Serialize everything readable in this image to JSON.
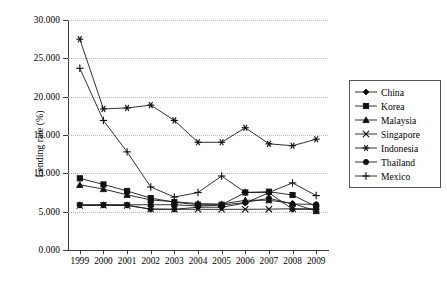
{
  "chart_data": {
    "type": "line",
    "title": "",
    "xlabel": "",
    "ylabel": "Lending rate (%)",
    "x": [
      "1999",
      "2000",
      "2001",
      "2002",
      "2003",
      "2004",
      "2005",
      "2006",
      "2007",
      "2008",
      "2009"
    ],
    "categories": [
      "1999",
      "2000",
      "2001",
      "2002",
      "2003",
      "2004",
      "2005",
      "2006",
      "2007",
      "2008",
      "2009"
    ],
    "ylim": [
      0,
      30
    ],
    "yticks": [
      0,
      5,
      10,
      15,
      20,
      25,
      30
    ],
    "ytick_labels": [
      "0.000",
      "5.000",
      "10.000",
      "15.000",
      "20.000",
      "25.000",
      "30.000"
    ],
    "grid": "horizontal-dotted",
    "legend_position": "right",
    "series": [
      {
        "name": "China",
        "marker": "diamond",
        "values": [
          5.85,
          5.85,
          5.85,
          5.31,
          5.31,
          5.58,
          5.58,
          6.12,
          7.47,
          5.31,
          5.31
        ]
      },
      {
        "name": "Korea",
        "marker": "square",
        "values": [
          9.35,
          8.55,
          7.7,
          6.77,
          6.24,
          5.91,
          5.9,
          7.5,
          7.6,
          7.17,
          5.65
        ]
      },
      {
        "name": "Malaysia",
        "marker": "triangle",
        "values": [
          8.5,
          7.95,
          7.2,
          6.53,
          6.3,
          6.05,
          6.0,
          6.49,
          6.49,
          6.08,
          5.08
        ]
      },
      {
        "name": "Singapore",
        "marker": "cross-x",
        "values": [
          5.8,
          5.83,
          5.8,
          5.35,
          5.31,
          5.31,
          5.3,
          5.31,
          5.33,
          5.38,
          5.38
        ]
      },
      {
        "name": "Indonesia",
        "marker": "asterisk",
        "values": [
          27.5,
          18.4,
          18.53,
          18.9,
          16.9,
          14.05,
          14.05,
          15.95,
          13.85,
          13.6,
          14.45
        ]
      },
      {
        "name": "Thailand",
        "marker": "circle",
        "values": [
          5.9,
          5.9,
          5.9,
          5.9,
          5.9,
          5.75,
          5.85,
          6.2,
          6.75,
          6.0,
          5.95
        ]
      },
      {
        "name": "Mexico",
        "marker": "plus",
        "values": [
          23.7,
          16.9,
          12.8,
          8.22,
          6.9,
          7.5,
          9.65,
          7.51,
          7.51,
          8.75,
          7.1
        ]
      }
    ]
  },
  "legend": {
    "items": [
      {
        "label": "China",
        "marker": "diamond-marker-icon"
      },
      {
        "label": "Korea",
        "marker": "square-marker-icon"
      },
      {
        "label": "Malaysia",
        "marker": "triangle-marker-icon"
      },
      {
        "label": "Singapore",
        "marker": "x-marker-icon"
      },
      {
        "label": "Indonesia",
        "marker": "asterisk-marker-icon"
      },
      {
        "label": "Thailand",
        "marker": "circle-marker-icon"
      },
      {
        "label": "Mexico",
        "marker": "plus-marker-icon"
      }
    ]
  },
  "colors": {
    "line": "#1a1a1a",
    "axis": "#3a3a3a",
    "grid": "#b9b9b9",
    "background": "#ffffff"
  }
}
